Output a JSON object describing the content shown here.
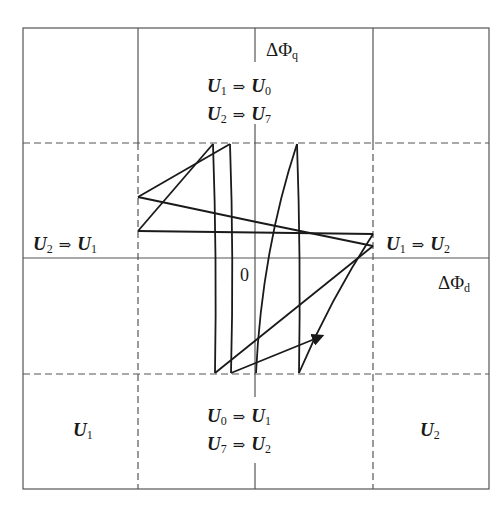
{
  "diagram": {
    "axes": {
      "q_axis_label": {
        "symbol": "ΔΦ",
        "subscript": "q"
      },
      "d_axis_label": {
        "symbol": "ΔΦ",
        "subscript": "d"
      },
      "origin_label": "0"
    },
    "arrow_symbol": "⇒",
    "regions": {
      "top_center": [
        {
          "from": "U",
          "from_sub": "1",
          "to": "U",
          "to_sub": "0"
        },
        {
          "from": "U",
          "from_sub": "2",
          "to": "U",
          "to_sub": "7"
        }
      ],
      "middle_left": [
        {
          "from": "U",
          "from_sub": "2",
          "to": "U",
          "to_sub": "1"
        }
      ],
      "middle_right": [
        {
          "from": "U",
          "from_sub": "1",
          "to": "U",
          "to_sub": "2"
        }
      ],
      "bottom_center": [
        {
          "from": "U",
          "from_sub": "0",
          "to": "U",
          "to_sub": "1"
        },
        {
          "from": "U",
          "from_sub": "7",
          "to": "U",
          "to_sub": "2"
        }
      ],
      "bottom_left": {
        "vec": "U",
        "sub": "1"
      },
      "bottom_right": {
        "vec": "U",
        "sub": "2"
      }
    },
    "colors": {
      "line": "#1a1a1a",
      "grid": "#555555",
      "background": "#ffffff"
    }
  }
}
